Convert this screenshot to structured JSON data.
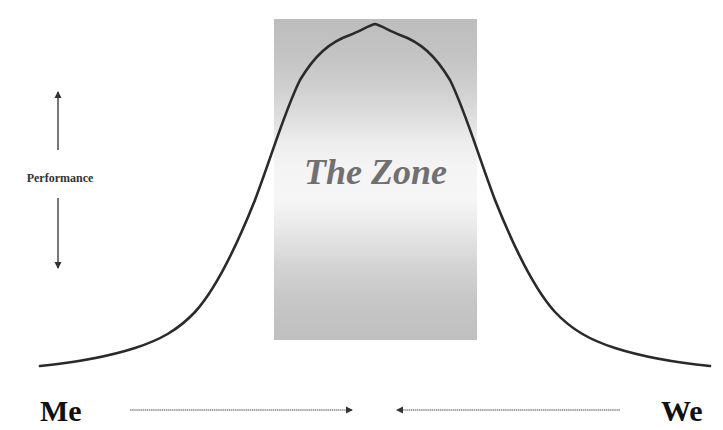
{
  "diagram": {
    "zone": {
      "label": "The Zone",
      "fill_top": "#bdbdbd",
      "fill_middle": "#f6f6f6",
      "fill_bottom": "#bfbfbf",
      "text_color": "#707070"
    },
    "y_axis": {
      "label": "Performance",
      "arrow": "double-headed vertical"
    },
    "x_axis": {
      "left_label": "Me",
      "right_label": "We",
      "left_arrow_direction": "right",
      "right_arrow_direction": "left"
    },
    "curve": {
      "shape": "bell",
      "color": "#2a2a2a"
    }
  }
}
